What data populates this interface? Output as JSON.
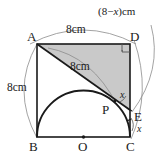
{
  "figure": {
    "vertices": {
      "a": "A",
      "b": "B",
      "c": "C",
      "d": "D",
      "e": "E",
      "p": "P",
      "o": "O"
    },
    "dimensions": {
      "top": "8cm",
      "left": "8cm",
      "diagonal": "8cm",
      "right_expr_open": "(8",
      "right_expr_minus": "−",
      "right_expr_var": "x",
      "right_expr_close": ")",
      "right_expr_unit": "cm",
      "right_full": "(8−x) cm"
    },
    "angles": {
      "at_e_upper": "x",
      "at_e_lower": "x"
    },
    "marks": {
      "right_angle_at_d": "right-angle",
      "center_dot_at_o": "center-point"
    },
    "colors": {
      "shade_fill": "#c9c9c9",
      "stroke_main": "#1a1a1a",
      "stroke_thin": "#8c8c8c",
      "background": "#ffffff"
    }
  }
}
